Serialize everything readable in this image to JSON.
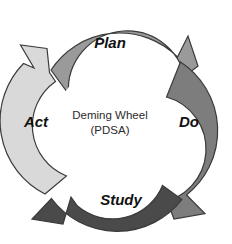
{
  "diagram": {
    "title": "Deming Wheel",
    "subtitle": "(PDSA)",
    "background_color": "#ffffff",
    "outline_color": "#3a3a3a",
    "hub_color": "#ffffff",
    "direction": "clockwise",
    "segments": [
      {
        "id": "plan",
        "label": "Plan",
        "color": "#9a9a9a",
        "position": "top",
        "label_x": 110,
        "label_y": 44,
        "order": 1
      },
      {
        "id": "do",
        "label": "Do",
        "color": "#7d7d7d",
        "position": "right",
        "label_x": 189,
        "label_y": 123,
        "order": 2
      },
      {
        "id": "study",
        "label": "Study",
        "color": "#4a4a4a",
        "position": "bottom",
        "label_x": 121,
        "label_y": 201,
        "order": 3
      },
      {
        "id": "act",
        "label": "Act",
        "color": "#d9d9d9",
        "position": "left",
        "label_x": 36,
        "label_y": 123,
        "order": 4
      }
    ]
  }
}
